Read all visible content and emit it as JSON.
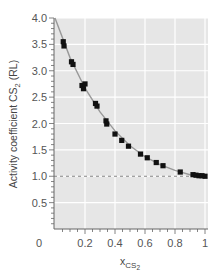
{
  "chart_data": {
    "type": "scatter",
    "title": "",
    "xlabel": "x",
    "xlabel_subscript": "CS",
    "xlabel_subsubscript": "2",
    "ylabel": "Activity coefficient CS",
    "ylabel_subscript": "2",
    "ylabel_suffix": " (RL)",
    "xlim": [
      0,
      1
    ],
    "ylim": [
      0,
      4
    ],
    "x_ticks": [
      0.2,
      0.4,
      0.6,
      0.8,
      1
    ],
    "x_tick_labels": [
      "0.2",
      "0.4",
      "0.6",
      "0.8",
      "1"
    ],
    "x_origin_label": "0",
    "y_ticks": [
      0.5,
      1.0,
      1.5,
      2.0,
      2.5,
      3.0,
      3.5,
      4.0
    ],
    "y_tick_labels": [
      "0.5",
      "1.0",
      "1.5",
      "2.0",
      "2.5",
      "3.0",
      "3.5",
      "4.0"
    ],
    "grid": true,
    "reference_line": {
      "y": 1.0,
      "style": "dashed"
    },
    "series": [
      {
        "name": "measured",
        "marker": "square",
        "color": "#111111",
        "x": [
          0.055,
          0.06,
          0.11,
          0.12,
          0.18,
          0.2,
          0.19,
          0.27,
          0.28,
          0.34,
          0.345,
          0.4,
          0.445,
          0.49,
          0.57,
          0.615,
          0.675,
          0.72,
          0.835,
          0.92,
          0.94,
          0.96,
          0.98,
          1.0
        ],
        "y": [
          3.55,
          3.47,
          3.17,
          3.12,
          2.72,
          2.75,
          2.66,
          2.38,
          2.33,
          2.05,
          1.99,
          1.8,
          1.68,
          1.57,
          1.42,
          1.35,
          1.26,
          1.2,
          1.08,
          1.03,
          1.02,
          1.01,
          1.01,
          1.0
        ]
      },
      {
        "name": "fit",
        "type": "line",
        "color": "#999999",
        "x": [
          0.0,
          0.1,
          0.2,
          0.3,
          0.4,
          0.5,
          0.6,
          0.7,
          0.8,
          0.9,
          1.0
        ],
        "y": [
          4.0,
          3.25,
          2.67,
          2.22,
          1.86,
          1.58,
          1.37,
          1.22,
          1.11,
          1.03,
          1.0
        ]
      }
    ]
  },
  "colors": {
    "plot_background": "#e6e6e6",
    "grid": "#ffffff",
    "axis": "#666666",
    "marker": "#111111",
    "fit_line": "#999999",
    "reference_line": "#777777"
  }
}
